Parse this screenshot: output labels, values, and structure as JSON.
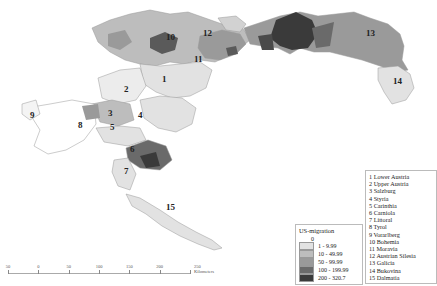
{
  "map": {
    "title": "",
    "colors": {
      "class0": "#ffffff",
      "class1": "#e2e2e2",
      "class2": "#bdbdbd",
      "class3": "#9a9a9a",
      "class4": "#6a6a6a",
      "class5": "#3a3a3a",
      "border": "#9a9a9a"
    },
    "region_labels": [
      "1",
      "2",
      "3",
      "4",
      "5",
      "6",
      "7",
      "8",
      "9",
      "10",
      "11",
      "12",
      "13",
      "14",
      "15"
    ]
  },
  "province_legend": {
    "items": [
      "1 Lower Austria",
      "2 Upper Austria",
      "3 Salzburg",
      "4 Styria",
      "5 Carinthia",
      "6 Carniola",
      "7 Littoral",
      "8 Tyrol",
      "9 Vorarlberg",
      "10 Bohemia",
      "11 Moravia",
      "12 Austrian Silesia",
      "13 Galicia",
      "14 Bukovina",
      "15 Dalmatia"
    ]
  },
  "color_legend": {
    "title": "US-migration",
    "classes": [
      {
        "label": "0",
        "color": "#ffffff"
      },
      {
        "label": "1 - 9.99",
        "color": "#e2e2e2"
      },
      {
        "label": "10 - 49.99",
        "color": "#bdbdbd"
      },
      {
        "label": "50 - 99.99",
        "color": "#9a9a9a"
      },
      {
        "label": "100 - 199.99",
        "color": "#6a6a6a"
      },
      {
        "label": "200 - 320.7",
        "color": "#3a3a3a"
      }
    ]
  },
  "scale_bar": {
    "labels": [
      "50",
      "0",
      "50",
      "100",
      "150",
      "200",
      "250 Kilometers"
    ]
  }
}
